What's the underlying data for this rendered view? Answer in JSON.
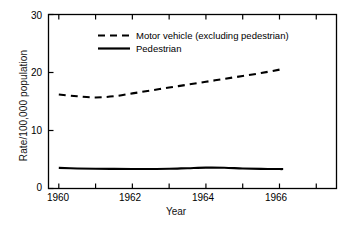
{
  "chart_data": {
    "type": "line",
    "title": "",
    "xlabel": "Year",
    "ylabel": "Rate/100,000 population",
    "xlim": [
      1959.72,
      1967.55
    ],
    "ylim": [
      0,
      30
    ],
    "grid": false,
    "legend_position": "inside-upper-left",
    "x_ticks": [
      1960,
      1961,
      1962,
      1963,
      1964,
      1965,
      1966,
      1967
    ],
    "x_tick_labels": [
      "1960",
      "",
      "1962",
      "",
      "1964",
      "",
      "1966",
      ""
    ],
    "y_ticks": [
      0,
      10,
      20,
      30
    ],
    "y_tick_labels": [
      "0",
      "10",
      "20",
      "30"
    ],
    "x": [
      1960,
      1960.5,
      1961,
      1961.5,
      1962,
      1962.5,
      1963,
      1963.5,
      1964,
      1964.5,
      1965,
      1965.5,
      1966,
      1966.1
    ],
    "series": [
      {
        "name": "Motor vehicle (excluding pedestrian)",
        "style": "dashed",
        "color": "#000000",
        "values": [
          16.2,
          15.9,
          15.7,
          15.9,
          16.4,
          16.9,
          17.4,
          17.9,
          18.4,
          18.9,
          19.4,
          19.9,
          20.5,
          20.7
        ]
      },
      {
        "name": "Pedestrian",
        "style": "solid",
        "color": "#000000",
        "values": [
          3.55,
          3.45,
          3.4,
          3.38,
          3.37,
          3.37,
          3.4,
          3.5,
          3.6,
          3.58,
          3.45,
          3.38,
          3.35,
          3.35
        ]
      }
    ]
  },
  "legend": {
    "entries": [
      {
        "label": "Motor vehicle (excluding pedestrian)",
        "style": "dashed"
      },
      {
        "label": "Pedestrian",
        "style": "solid"
      }
    ]
  },
  "axes": {
    "y_title": "Rate/100,000 population",
    "x_title": "Year",
    "y_tick_0": "0",
    "y_tick_1": "10",
    "y_tick_2": "20",
    "y_tick_3": "30",
    "x_tick_1960": "1960",
    "x_tick_1962": "1962",
    "x_tick_1964": "1964",
    "x_tick_1966": "1966"
  },
  "colors": {
    "background": "#ffffff",
    "foreground": "#000000",
    "axis": "#000000"
  }
}
